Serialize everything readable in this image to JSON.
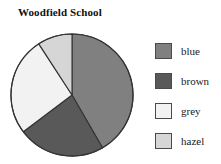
{
  "chart_data": {
    "type": "pie",
    "title": "Woodfield School",
    "subtitle": "",
    "xlabel": "",
    "ylabel": "",
    "grid": false,
    "legend_position": "right",
    "categories": [
      "blue",
      "brown",
      "grey",
      "hazel"
    ],
    "values": [
      42,
      23,
      26,
      9
    ],
    "units": "percent",
    "start_angle_deg": 0,
    "direction": "clockwise",
    "slices": [
      {
        "label": "blue",
        "value": 42,
        "start_deg": 0,
        "end_deg": 150,
        "color": "#808080",
        "stroke": "#333333"
      },
      {
        "label": "brown",
        "value": 23,
        "start_deg": 150,
        "end_deg": 233,
        "color": "#595959",
        "stroke": "#333333"
      },
      {
        "label": "grey",
        "value": 26,
        "start_deg": 233,
        "end_deg": 327,
        "color": "#f2f2f2",
        "stroke": "#333333"
      },
      {
        "label": "hazel",
        "value": 9,
        "start_deg": 327,
        "end_deg": 360,
        "color": "#d6d6d6",
        "stroke": "#333333"
      }
    ]
  },
  "chart": {
    "title": "Woodfield School",
    "geometry": {
      "cx": 62,
      "cy": 62,
      "r": 61
    }
  },
  "legend": {
    "items": [
      {
        "label": "blue",
        "color": "#808080",
        "top": 6
      },
      {
        "label": "brown",
        "color": "#595959",
        "top": 36
      },
      {
        "label": "grey",
        "color": "#f2f2f2",
        "top": 66
      },
      {
        "label": "hazel",
        "color": "#d6d6d6",
        "top": 96
      }
    ]
  },
  "colors": {
    "background": "#ffffff",
    "outline": "#333333",
    "swatch_border": "#4a4a4a",
    "text": "#111111"
  }
}
